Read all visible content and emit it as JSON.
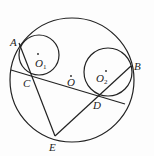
{
  "diagram": {
    "type": "geometry",
    "circles": [
      {
        "name": "O",
        "cx": 72,
        "cy": 80,
        "r": 62
      },
      {
        "name": "O1",
        "cx": 38,
        "cy": 52,
        "r": 20
      },
      {
        "name": "O2",
        "cx": 107,
        "cy": 73,
        "r": 24
      }
    ],
    "points": {
      "A": {
        "label": "A",
        "x": 19,
        "y": 43
      },
      "B": {
        "label": "B",
        "x": 131,
        "y": 66
      },
      "C": {
        "label": "C",
        "x": 33,
        "y": 76
      },
      "D": {
        "label": "D",
        "x": 98,
        "y": 97
      },
      "E": {
        "label": "E",
        "x": 55,
        "y": 136
      },
      "O": {
        "label": "O",
        "x": 71,
        "y": 78
      },
      "O1": {
        "label": "O",
        "sub": "1",
        "x": 38,
        "y": 55
      },
      "O2": {
        "label": "O",
        "sub": "2",
        "x": 106,
        "y": 73
      }
    },
    "segments": [
      {
        "from": "A",
        "to": "E"
      },
      {
        "from": "E",
        "to": "B"
      },
      {
        "from": "chord-left",
        "to": "chord-right",
        "through": [
          "C",
          "D"
        ]
      }
    ],
    "colors": {
      "stroke": "#222222",
      "background": "#fdfdfd"
    }
  }
}
